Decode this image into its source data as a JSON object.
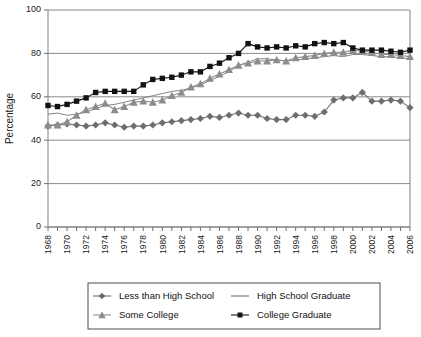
{
  "chart_data": {
    "type": "line",
    "title": "",
    "xlabel": "",
    "ylabel": "Percentage",
    "ylim": [
      0,
      100
    ],
    "yticks": [
      0,
      20,
      40,
      60,
      80,
      100
    ],
    "xlim": [
      1968,
      2006
    ],
    "grid": true,
    "legend_position": "bottom",
    "x": [
      1968,
      1969,
      1970,
      1971,
      1972,
      1973,
      1974,
      1975,
      1976,
      1977,
      1978,
      1979,
      1980,
      1981,
      1982,
      1983,
      1984,
      1985,
      1986,
      1987,
      1988,
      1989,
      1990,
      1991,
      1992,
      1993,
      1994,
      1995,
      1996,
      1997,
      1998,
      1999,
      2000,
      2001,
      2002,
      2003,
      2004,
      2005,
      2006
    ],
    "xtick_labels": [
      "1968",
      "1970",
      "1972",
      "1974",
      "1976",
      "1978",
      "1980",
      "1982",
      "1984",
      "1986",
      "1988",
      "1990",
      "1992",
      "1994",
      "1996",
      "1998",
      "2000",
      "2002",
      "2004",
      "2006"
    ],
    "series": [
      {
        "name": "Less than High School",
        "marker": "diamond",
        "color": "#6e6e6e",
        "values": [
          46.5,
          47.0,
          47.5,
          47.0,
          46.5,
          47.0,
          48.0,
          47.0,
          46.0,
          46.5,
          46.5,
          47.0,
          48.0,
          48.5,
          49.0,
          49.5,
          50.0,
          51.0,
          50.5,
          51.5,
          52.5,
          51.5,
          51.5,
          50.0,
          49.5,
          49.5,
          51.5,
          51.5,
          51.0,
          53.0,
          58.5,
          59.5,
          59.5,
          62.0,
          58.0,
          58.0,
          58.5,
          58.0,
          55.0
        ]
      },
      {
        "name": "High School Graduate",
        "marker": "none",
        "color": "#777777",
        "values": [
          52.0,
          52.5,
          51.5,
          52.0,
          53.0,
          54.5,
          56.0,
          56.5,
          57.5,
          58.5,
          59.5,
          60.5,
          61.5,
          62.5,
          63.0,
          64.0,
          65.5,
          67.5,
          69.5,
          71.5,
          74.5,
          76.0,
          77.5,
          77.5,
          77.0,
          76.5,
          77.0,
          77.5,
          78.0,
          78.5,
          79.0,
          78.5,
          79.5,
          79.5,
          79.0,
          78.5,
          78.5,
          78.0,
          77.5
        ]
      },
      {
        "name": "Some College",
        "marker": "triangle",
        "color": "#8c8c8c",
        "values": [
          47.0,
          47.0,
          48.5,
          51.5,
          54.0,
          55.5,
          57.0,
          54.0,
          55.5,
          57.5,
          58.0,
          57.5,
          58.5,
          60.5,
          62.0,
          64.5,
          66.0,
          68.5,
          70.5,
          72.5,
          74.5,
          75.5,
          76.5,
          76.5,
          77.0,
          76.5,
          78.0,
          78.5,
          79.0,
          80.0,
          80.5,
          80.5,
          81.5,
          81.0,
          80.5,
          79.5,
          79.5,
          79.0,
          78.5
        ]
      },
      {
        "name": "College Graduate",
        "marker": "square",
        "color": "#121212",
        "values": [
          56.0,
          55.5,
          56.5,
          58.0,
          59.5,
          62.0,
          62.5,
          62.5,
          62.5,
          62.5,
          65.5,
          68.0,
          68.5,
          69.0,
          70.0,
          71.5,
          71.5,
          74.0,
          75.5,
          78.0,
          80.0,
          84.5,
          83.0,
          82.5,
          83.0,
          82.5,
          83.5,
          83.0,
          84.5,
          85.0,
          84.5,
          85.0,
          82.5,
          81.5,
          81.5,
          81.5,
          81.0,
          80.5,
          81.5
        ]
      }
    ]
  },
  "legend": {
    "items": [
      {
        "label": "Less than High School",
        "marker": "diamond",
        "color": "#6e6e6e"
      },
      {
        "label": "High School Graduate",
        "marker": "none",
        "color": "#777777"
      },
      {
        "label": "Some College",
        "marker": "triangle",
        "color": "#8c8c8c"
      },
      {
        "label": "College Graduate",
        "marker": "square",
        "color": "#121212"
      }
    ]
  },
  "caption": {
    "text": ""
  }
}
